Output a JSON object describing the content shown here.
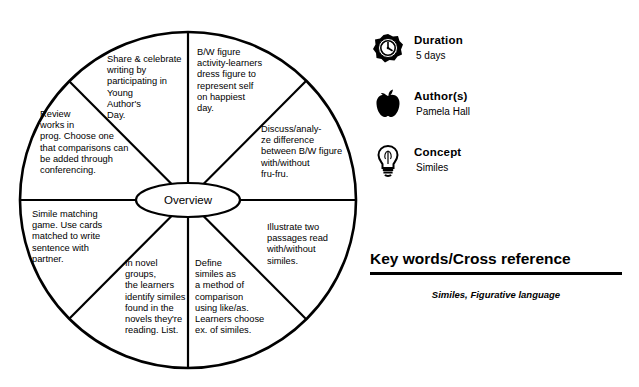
{
  "wheel": {
    "center_label": "Overview",
    "segments": [
      {
        "id": "seg-top-right",
        "text": "B/W figure\nactivity-learners\ndress figure to\nrepresent self\non happiest\nday."
      },
      {
        "id": "seg-upper-right",
        "text": "Discuss/analy-\nze difference\nbetween B/W figure\nwith/without\nfru-fru."
      },
      {
        "id": "seg-lower-right",
        "text": "Illustrate two\npassages read\nwith/without\nsimiles."
      },
      {
        "id": "seg-bottom-right",
        "text": "Define\nsimiles as\na method of\ncomparison\nusing like/as.\nLearners choose\nex. of similes."
      },
      {
        "id": "seg-bottom-left",
        "text": "In novel\ngroups,\nthe learners\nidentify similes\nfound in the\nnovels they're\nreading. List."
      },
      {
        "id": "seg-lower-left",
        "text": "Simile matching\ngame. Use cards\nmatched to write\nsentence with\npartner."
      },
      {
        "id": "seg-upper-left",
        "text": "Review\nworks in\nprog. Choose one\nthat comparisons can\nbe added through\nconferencing."
      },
      {
        "id": "seg-top-left",
        "text": "Share & celebrate\nwriting by\nparticipating in\nYoung\nAuthor's\nDay."
      }
    ]
  },
  "info": {
    "duration": {
      "icon": "clock-icon",
      "label": "Duration",
      "value": "5 days"
    },
    "author": {
      "icon": "apple-icon",
      "label": "Author(s)",
      "value": "Pamela Hall"
    },
    "concept": {
      "icon": "lightbulb-icon",
      "label": "Concept",
      "value": "Similes"
    }
  },
  "keywords": {
    "title": "Key words/Cross reference",
    "value": "Similes, Figurative language"
  }
}
